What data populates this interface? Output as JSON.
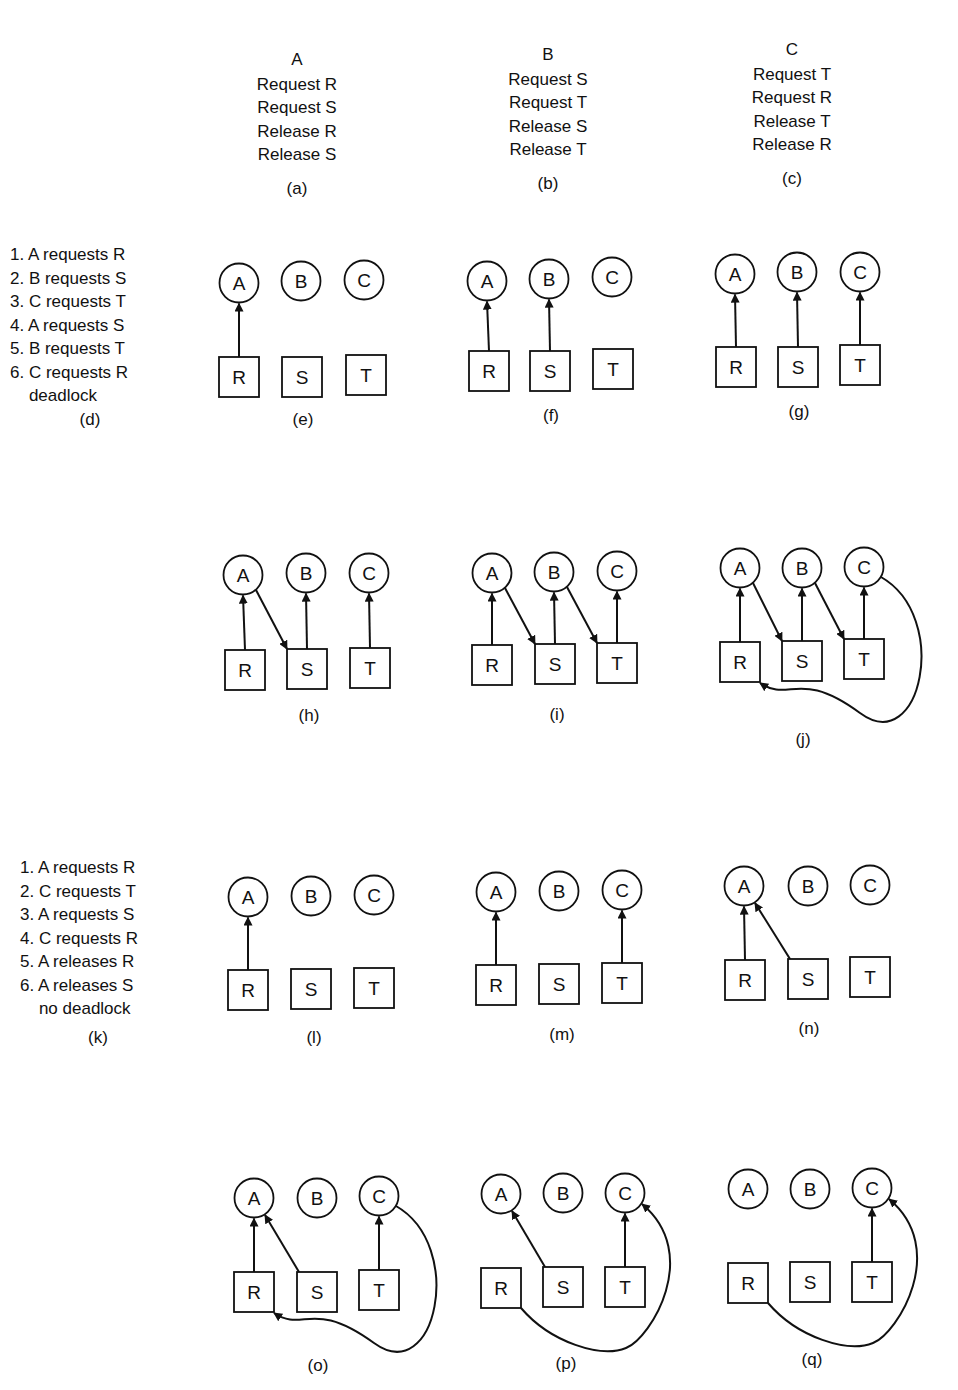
{
  "processes": [
    {
      "id": "a",
      "name": "A",
      "ops": [
        "Request R",
        "Request S",
        "Release R",
        "Release S"
      ],
      "caption": "(a)",
      "x": 297,
      "y": 48
    },
    {
      "id": "b",
      "name": "B",
      "ops": [
        "Request S",
        "Request T",
        "Release S",
        "Release T"
      ],
      "caption": "(b)",
      "x": 548,
      "y": 43
    },
    {
      "id": "c",
      "name": "C",
      "ops": [
        "Request T",
        "Request R",
        "Release T",
        "Release R"
      ],
      "caption": "(c)",
      "x": 792,
      "y": 38
    }
  ],
  "sequences": [
    {
      "id": "d",
      "x": 10,
      "y": 243,
      "caption": "(d)",
      "caption_x": 90,
      "caption_y": 422,
      "steps": [
        "1. A requests R",
        "2. B requests S",
        "3. C requests T",
        "4. A requests S",
        "5. B requests T",
        "6. C requests R",
        "    deadlock"
      ]
    },
    {
      "id": "k",
      "x": 20,
      "y": 856,
      "caption": "(k)",
      "caption_x": 98,
      "caption_y": 1040,
      "steps": [
        "1. A requests R",
        "2. C requests T",
        "3. A requests S",
        "4. C requests R",
        "5. A releases R",
        "6. A releases S",
        "    no deadlock"
      ]
    }
  ],
  "graphs": [
    {
      "id": "e",
      "caption": "(e)",
      "cap": [
        303,
        422
      ],
      "nodes": {
        "A": [
          239,
          283
        ],
        "B": [
          301,
          281
        ],
        "C": [
          364,
          280
        ],
        "R": [
          239,
          377
        ],
        "S": [
          302,
          377
        ],
        "T": [
          366,
          375
        ]
      },
      "edges": [
        [
          "R",
          "A",
          "up"
        ]
      ]
    },
    {
      "id": "f",
      "caption": "(f)",
      "cap": [
        551,
        418
      ],
      "nodes": {
        "A": [
          487,
          281
        ],
        "B": [
          549,
          279
        ],
        "C": [
          612,
          277
        ],
        "R": [
          489,
          371
        ],
        "S": [
          550,
          371
        ],
        "T": [
          613,
          369
        ]
      },
      "edges": [
        [
          "R",
          "A",
          "up"
        ],
        [
          "S",
          "B",
          "up"
        ]
      ]
    },
    {
      "id": "g",
      "caption": "(g)",
      "cap": [
        799,
        414
      ],
      "nodes": {
        "A": [
          735,
          274
        ],
        "B": [
          797,
          272
        ],
        "C": [
          860,
          272
        ],
        "R": [
          736,
          367
        ],
        "S": [
          798,
          367
        ],
        "T": [
          860,
          365
        ]
      },
      "edges": [
        [
          "R",
          "A",
          "up"
        ],
        [
          "S",
          "B",
          "up"
        ],
        [
          "T",
          "C",
          "up"
        ]
      ]
    },
    {
      "id": "h",
      "caption": "(h)",
      "cap": [
        309,
        718
      ],
      "nodes": {
        "A": [
          243,
          575
        ],
        "B": [
          306,
          573
        ],
        "C": [
          369,
          573
        ],
        "R": [
          245,
          670
        ],
        "S": [
          307,
          669
        ],
        "T": [
          370,
          668
        ]
      },
      "edges": [
        [
          "R",
          "A",
          "up"
        ],
        [
          "S",
          "B",
          "up"
        ],
        [
          "T",
          "C",
          "up"
        ],
        [
          "A",
          "S",
          "diag"
        ]
      ]
    },
    {
      "id": "i",
      "caption": "(i)",
      "cap": [
        557,
        717
      ],
      "nodes": {
        "A": [
          492,
          573
        ],
        "B": [
          554,
          572
        ],
        "C": [
          617,
          571
        ],
        "R": [
          492,
          665
        ],
        "S": [
          555,
          664
        ],
        "T": [
          617,
          663
        ]
      },
      "edges": [
        [
          "R",
          "A",
          "up"
        ],
        [
          "S",
          "B",
          "up"
        ],
        [
          "T",
          "C",
          "up"
        ],
        [
          "A",
          "S",
          "diag"
        ],
        [
          "B",
          "T",
          "diag"
        ]
      ]
    },
    {
      "id": "j",
      "caption": "(j)",
      "cap": [
        803,
        742
      ],
      "nodes": {
        "A": [
          740,
          568
        ],
        "B": [
          802,
          568
        ],
        "C": [
          864,
          567
        ],
        "R": [
          740,
          662
        ],
        "S": [
          802,
          661
        ],
        "T": [
          864,
          659
        ]
      },
      "edges": [
        [
          "R",
          "A",
          "up"
        ],
        [
          "S",
          "B",
          "up"
        ],
        [
          "T",
          "C",
          "up"
        ],
        [
          "A",
          "S",
          "diag"
        ],
        [
          "B",
          "T",
          "diag"
        ],
        [
          "C",
          "R",
          "curve"
        ]
      ]
    },
    {
      "id": "l",
      "caption": "(l)",
      "cap": [
        314,
        1040
      ],
      "nodes": {
        "A": [
          248,
          897
        ],
        "B": [
          311,
          896
        ],
        "C": [
          374,
          895
        ],
        "R": [
          248,
          990
        ],
        "S": [
          311,
          989
        ],
        "T": [
          374,
          988
        ]
      },
      "edges": [
        [
          "R",
          "A",
          "up"
        ]
      ]
    },
    {
      "id": "m",
      "caption": "(m)",
      "cap": [
        562,
        1037
      ],
      "nodes": {
        "A": [
          496,
          892
        ],
        "B": [
          559,
          891
        ],
        "C": [
          622,
          890
        ],
        "R": [
          496,
          985
        ],
        "S": [
          559,
          984
        ],
        "T": [
          622,
          983
        ]
      },
      "edges": [
        [
          "R",
          "A",
          "up"
        ],
        [
          "T",
          "C",
          "up"
        ]
      ]
    },
    {
      "id": "n",
      "caption": "(n)",
      "cap": [
        809,
        1031
      ],
      "nodes": {
        "A": [
          744,
          886
        ],
        "B": [
          808,
          886
        ],
        "C": [
          870,
          885
        ],
        "R": [
          745,
          980
        ],
        "S": [
          808,
          979
        ],
        "T": [
          870,
          977
        ]
      },
      "edges": [
        [
          "R",
          "A",
          "up"
        ],
        [
          "S",
          "A",
          "diagup"
        ]
      ]
    },
    {
      "id": "o",
      "caption": "(o)",
      "cap": [
        318,
        1368
      ],
      "nodes": {
        "A": [
          254,
          1198
        ],
        "B": [
          317,
          1198
        ],
        "C": [
          379,
          1196
        ],
        "R": [
          254,
          1292
        ],
        "S": [
          317,
          1292
        ],
        "T": [
          379,
          1290
        ]
      },
      "edges": [
        [
          "R",
          "A",
          "up"
        ],
        [
          "S",
          "A",
          "diagup"
        ],
        [
          "T",
          "C",
          "up"
        ],
        [
          "C",
          "R",
          "curve"
        ]
      ]
    },
    {
      "id": "p",
      "caption": "(p)",
      "cap": [
        566,
        1366
      ],
      "nodes": {
        "A": [
          501,
          1194
        ],
        "B": [
          563,
          1193
        ],
        "C": [
          625,
          1193
        ],
        "R": [
          501,
          1288
        ],
        "S": [
          563,
          1287
        ],
        "T": [
          625,
          1287
        ]
      },
      "edges": [
        [
          "S",
          "A",
          "diagup"
        ],
        [
          "T",
          "C",
          "up"
        ],
        [
          "R",
          "C",
          "curveup"
        ]
      ]
    },
    {
      "id": "q",
      "caption": "(q)",
      "cap": [
        812,
        1362
      ],
      "nodes": {
        "A": [
          748,
          1189
        ],
        "B": [
          810,
          1189
        ],
        "C": [
          872,
          1188
        ],
        "R": [
          748,
          1283
        ],
        "S": [
          810,
          1282
        ],
        "T": [
          872,
          1282
        ]
      },
      "edges": [
        [
          "T",
          "C",
          "up"
        ],
        [
          "R",
          "C",
          "curveup"
        ]
      ]
    }
  ],
  "style": {
    "stroke": "#111111",
    "background": "#ffffff"
  }
}
